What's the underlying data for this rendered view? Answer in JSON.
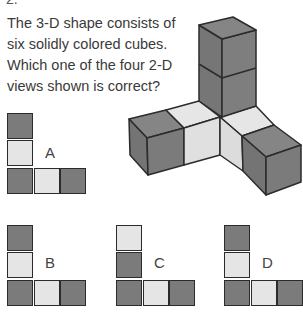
{
  "question": {
    "number_partial": "2.",
    "lines": [
      "The 3-D shape consists of",
      "six solidly colored cubes.",
      "Which one of the four 2-D",
      "views shown is correct?"
    ]
  },
  "colors": {
    "dark": "#7b7b7b",
    "light": "#e5e5e5",
    "border": "#2b2b2b"
  },
  "shape_3d": {
    "description": "Vertical column of two dark cubes on a light corner cube; left arm: light cube then dark cube; right arm: light cube then dark cube"
  },
  "options": [
    {
      "label": "A",
      "column_top_to_bottom": [
        "dark",
        "light",
        "dark"
      ],
      "row_left_to_right": [
        "dark",
        "light",
        "dark"
      ]
    },
    {
      "label": "B",
      "column_top_to_bottom": [
        "dark",
        "light",
        "dark"
      ],
      "row_left_to_right": [
        "dark",
        "light",
        "dark"
      ]
    },
    {
      "label": "C",
      "column_top_to_bottom": [
        "light",
        "dark",
        "dark"
      ],
      "row_left_to_right": [
        "dark",
        "light",
        "dark"
      ]
    },
    {
      "label": "D",
      "column_top_to_bottom": [
        "dark",
        "light",
        "dark"
      ],
      "row_left_to_right": [
        "dark",
        "light",
        "dark"
      ]
    }
  ]
}
